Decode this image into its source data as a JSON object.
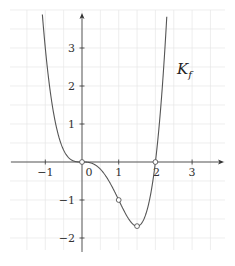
{
  "chart_data": {
    "type": "line",
    "title": "",
    "xlabel": "",
    "ylabel": "",
    "function": "f(x) = x^4 - 2x^3",
    "curve_label": "K",
    "curve_label_sub": "f",
    "xlim": [
      -1.5,
      3.5
    ],
    "ylim": [
      -2.2,
      3.9
    ],
    "x_ticks": [
      -1,
      0,
      1,
      2,
      3
    ],
    "x_tick_labels": [
      "−1",
      "0",
      "1",
      "2",
      "3"
    ],
    "y_ticks": [
      -2,
      -1,
      1,
      2,
      3
    ],
    "y_tick_labels": [
      "−2",
      "−1",
      "1",
      "2",
      "3"
    ],
    "grid": true,
    "grid_step": 0.5,
    "series": [
      {
        "name": "K_f",
        "x": [
          -1.1,
          -1.0,
          -0.75,
          -0.5,
          -0.25,
          0,
          0.25,
          0.5,
          0.75,
          1.0,
          1.25,
          1.5,
          1.75,
          2.0,
          2.25,
          2.35
        ],
        "y": [
          3.126,
          3.0,
          1.16,
          0.3125,
          0.0352,
          0,
          -0.0273,
          -0.1875,
          -0.5273,
          -1.0,
          -1.4648,
          -1.6875,
          -1.3398,
          0,
          2.8477,
          4.5
        ]
      }
    ],
    "marked_points": [
      {
        "x": 0,
        "y": 0
      },
      {
        "x": 1,
        "y": -1
      },
      {
        "x": 1.5,
        "y": -1.6875
      },
      {
        "x": 2,
        "y": 0
      }
    ],
    "colors": {
      "curve": "#555555",
      "axis": "#333333",
      "grid": "#e6e6e6"
    }
  }
}
